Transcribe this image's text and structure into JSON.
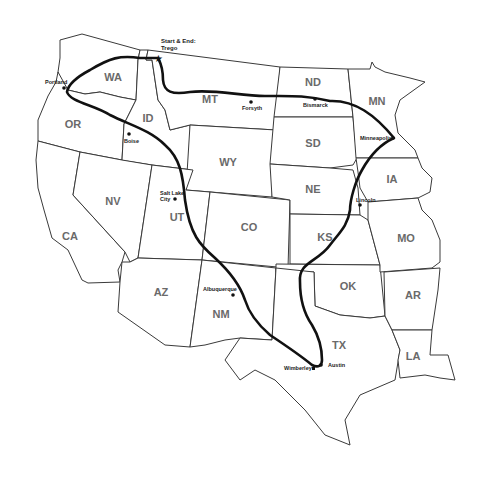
{
  "map": {
    "title": "Western US Road Trip Route",
    "start_end": {
      "label_line1": "Start & End:",
      "label_line2": "Trego",
      "icon": "star-icon"
    },
    "states": [
      {
        "abbr": "WA"
      },
      {
        "abbr": "OR"
      },
      {
        "abbr": "CA"
      },
      {
        "abbr": "ID"
      },
      {
        "abbr": "NV"
      },
      {
        "abbr": "MT"
      },
      {
        "abbr": "WY"
      },
      {
        "abbr": "UT"
      },
      {
        "abbr": "AZ"
      },
      {
        "abbr": "CO"
      },
      {
        "abbr": "NM"
      },
      {
        "abbr": "ND"
      },
      {
        "abbr": "SD"
      },
      {
        "abbr": "NE"
      },
      {
        "abbr": "KS"
      },
      {
        "abbr": "OK"
      },
      {
        "abbr": "TX"
      },
      {
        "abbr": "MN"
      },
      {
        "abbr": "IA"
      },
      {
        "abbr": "MO"
      },
      {
        "abbr": "AR"
      },
      {
        "abbr": "LA"
      }
    ],
    "cities": [
      {
        "name": "Portland"
      },
      {
        "name": "Boise"
      },
      {
        "name": "Forsyth"
      },
      {
        "name": "Bismarck"
      },
      {
        "name": "Minneapolis"
      },
      {
        "name": "Lincoln"
      },
      {
        "name": "Salt Lake City",
        "line1": "Salt Lake",
        "line2": "City"
      },
      {
        "name": "Albuquerque"
      },
      {
        "name": "Wimberley"
      },
      {
        "name": "Austin"
      }
    ],
    "route_color": "#111111",
    "border_color": "#3a3a3a",
    "label_color": "#6a6a6a"
  }
}
